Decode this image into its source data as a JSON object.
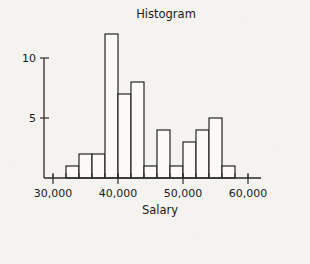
{
  "chart_data": {
    "type": "bar",
    "title": "Histogram",
    "xlabel": "Salary",
    "ylabel": "",
    "bin_width": 2000,
    "bin_starts": [
      32000,
      34000,
      36000,
      38000,
      40000,
      42000,
      44000,
      46000,
      48000,
      50000,
      52000,
      54000,
      56000
    ],
    "categories": [
      "32,000-34,000",
      "34,000-36,000",
      "36,000-38,000",
      "38,000-40,000",
      "40,000-42,000",
      "42,000-44,000",
      "44,000-46,000",
      "46,000-48,000",
      "48,000-50,000",
      "50,000-52,000",
      "52,000-54,000",
      "54,000-56,000",
      "56,000-58,000"
    ],
    "values": [
      1,
      2,
      2,
      12,
      7,
      8,
      1,
      4,
      1,
      3,
      4,
      5,
      1
    ],
    "xlim": [
      29000,
      62000
    ],
    "ylim": [
      0,
      13
    ],
    "x_tick_values": [
      30000,
      40000,
      50000,
      60000
    ],
    "x_tick_labels": [
      "30,000",
      "40,000",
      "50,000",
      "60,000"
    ],
    "x_minor_tick_step": 2000,
    "y_tick_values": [
      5,
      10
    ],
    "y_tick_labels": [
      "5",
      "10"
    ],
    "grid": false,
    "legend": false,
    "colors": {
      "background": "#f4f3f0",
      "bar_fill": "#fbfaf8",
      "bar_stroke": "#1d1d1d",
      "axis": "#2a2a2a",
      "text": "#1b1b1b"
    }
  }
}
